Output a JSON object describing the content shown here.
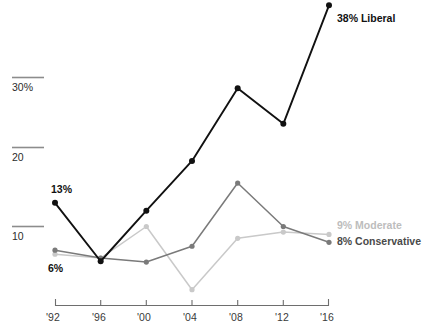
{
  "chart_data": {
    "type": "line",
    "title": "",
    "subtitle": "",
    "xlabel": "",
    "ylabel": "",
    "categories": [
      "'92",
      "'96",
      "'00",
      "'04",
      "'08",
      "'12",
      "'16"
    ],
    "ylim": [
      0,
      40
    ],
    "xlim_years": [
      1992,
      2016
    ],
    "grid": "horizontal-partial-left",
    "legend_position": "right-inline-end-of-line",
    "ytick_labels": [
      "30%",
      "20",
      "10"
    ],
    "ytick_values": [
      30,
      20,
      10
    ],
    "series": [
      {
        "name": "Liberal",
        "color": "#111111",
        "end_label": "38% Liberal",
        "end_value": 38,
        "start_label": "13%",
        "start_value": 13,
        "values": [
          13,
          5.6,
          12,
          18.3,
          27.5,
          23,
          38
        ]
      },
      {
        "name": "Conservative",
        "color": "#7a7a7a",
        "end_label": "8% Conservative",
        "end_value": 8,
        "start_label": "6%",
        "start_value": 7,
        "values": [
          7,
          6,
          5.5,
          7.5,
          15.5,
          10,
          8
        ]
      },
      {
        "name": "Moderate",
        "color": "#c9c9c9",
        "end_label": "9% Moderate",
        "end_value": 9,
        "start_label": "",
        "start_value": 6.5,
        "values": [
          6.5,
          6,
          10,
          2,
          8.5,
          9.3,
          9
        ]
      }
    ],
    "annotations": [
      {
        "text": "13%",
        "series": "Liberal",
        "category": "'92",
        "placement": "above"
      },
      {
        "text": "6%",
        "series": "Conservative",
        "category": "'92",
        "placement": "below"
      },
      {
        "text": "38% Liberal",
        "series": "Liberal",
        "category": "'16",
        "placement": "right"
      },
      {
        "text": "9% Moderate",
        "series": "Moderate",
        "category": "'16",
        "placement": "right"
      },
      {
        "text": "8% Conservative",
        "series": "Conservative",
        "category": "'16",
        "placement": "right"
      }
    ]
  },
  "axes": {
    "x_ticks": [
      {
        "label": "'92"
      },
      {
        "label": "'96"
      },
      {
        "label": "'00"
      },
      {
        "label": "'04"
      },
      {
        "label": "'08"
      },
      {
        "label": "'12"
      },
      {
        "label": "'16"
      }
    ],
    "y_ticks": [
      {
        "label": "30%"
      },
      {
        "label": "20"
      },
      {
        "label": "10"
      }
    ]
  },
  "colors": {
    "liberal": "#111111",
    "conservative": "#7a7a7a",
    "moderate": "#c9c9c9",
    "axis": "#6e6e6e",
    "gridline": "#8c8c8c",
    "background": "#ffffff"
  }
}
